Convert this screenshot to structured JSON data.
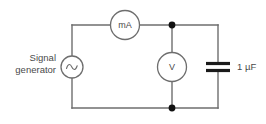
{
  "figure": {
    "type": "circuit-diagram",
    "background_color": "#ffffff",
    "wire_color": "#6e6e6e",
    "node_color": "#111111",
    "text_color": "#4a4a4a"
  },
  "labels": {
    "source_line1": "Signal",
    "source_line2": "generator",
    "ammeter": "mA",
    "voltmeter": "V",
    "capacitor_value": "1 µF"
  },
  "components": [
    {
      "name": "signal-generator",
      "symbol": "ac-source",
      "label": "Signal generator",
      "shape": "circle-with-sine",
      "cx": 72,
      "cy": 67,
      "r": 11
    },
    {
      "name": "milliammeter",
      "symbol": "ammeter",
      "label": "mA",
      "shape": "circle",
      "cx": 125,
      "cy": 25,
      "r": 14.5
    },
    {
      "name": "voltmeter",
      "symbol": "voltmeter",
      "label": "V",
      "shape": "circle",
      "cx": 172,
      "cy": 67,
      "r": 14.5
    },
    {
      "name": "capacitor",
      "symbol": "capacitor",
      "label": "1 µF",
      "shape": "parallel-plates",
      "cx": 218,
      "cy": 67
    }
  ],
  "nodes": [
    {
      "name": "top-junction",
      "x": 172,
      "y": 25
    },
    {
      "name": "bottom-junction",
      "x": 172,
      "y": 108
    }
  ],
  "layout": {
    "left_rail_x": 72,
    "right_rail_x": 218,
    "top_rail_y": 25,
    "bottom_rail_y": 108
  }
}
